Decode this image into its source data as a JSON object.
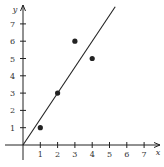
{
  "chart_data": {
    "type": "scatter",
    "title": "",
    "xlabel": "x",
    "ylabel": "y",
    "xlim": [
      0,
      7.5
    ],
    "ylim": [
      0,
      8
    ],
    "grid": false,
    "legend": null,
    "x_ticks": [
      "1",
      "2",
      "3",
      "4",
      "5",
      "6",
      "7"
    ],
    "y_ticks": [
      "1",
      "2",
      "3",
      "4",
      "5",
      "6",
      "7"
    ],
    "series": [
      {
        "name": "data points",
        "type": "scatter",
        "points": [
          {
            "x": 1,
            "y": 1
          },
          {
            "x": 2,
            "y": 3
          },
          {
            "x": 3,
            "y": 6
          },
          {
            "x": 4,
            "y": 5
          }
        ]
      },
      {
        "name": "fitted line",
        "type": "line",
        "equation": "y = 1.5x",
        "slope": 1.5,
        "intercept": 0,
        "x_range": [
          0,
          5.33
        ]
      }
    ]
  },
  "colors": {
    "ink": "#222222",
    "background": "#ffffff"
  }
}
